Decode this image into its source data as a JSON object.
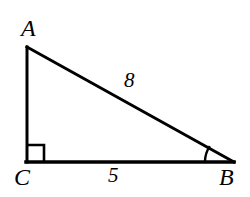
{
  "figure": {
    "kind": "right-triangle-diagram",
    "background_color": "#ffffff",
    "stroke_color": "#000000",
    "stroke_width": 3,
    "vertices": {
      "A": {
        "label": "A",
        "x": 27,
        "y": 47
      },
      "C": {
        "label": "C",
        "x": 27,
        "y": 162
      },
      "B": {
        "label": "B",
        "x": 233,
        "y": 162
      }
    },
    "sides": {
      "hypotenuse": {
        "from": "A",
        "to": "B",
        "label": "8",
        "value": 8
      },
      "base": {
        "from": "C",
        "to": "B",
        "label": "5",
        "value": 5
      },
      "vertical_leg": {
        "from": "A",
        "to": "C",
        "label": "",
        "value": null
      }
    },
    "markers": {
      "right_angle": {
        "at": "C",
        "name": "right-angle-square",
        "size": 16
      },
      "angle_arc": {
        "at": "B",
        "name": "angle-arc-at-b",
        "radius": 28
      }
    }
  }
}
